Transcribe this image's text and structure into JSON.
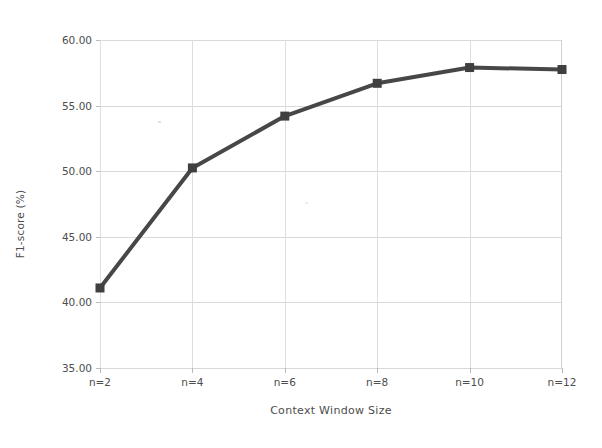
{
  "chart_data": {
    "type": "line",
    "title": "",
    "subtitle": "",
    "xlabel": "Context Window Size",
    "ylabel": "F1-score (%)",
    "categories": [
      "n=2",
      "n=4",
      "n=6",
      "n=8",
      "n=10",
      "n=12"
    ],
    "values": [
      41.1,
      50.25,
      54.2,
      56.7,
      57.9,
      57.75
    ],
    "series": [
      {
        "name": "F1-score",
        "values": [
          41.1,
          50.25,
          54.2,
          56.7,
          57.9,
          57.75
        ]
      }
    ],
    "ylim": [
      35.0,
      60.0
    ],
    "ytick_labels": [
      "35.00",
      "40.00",
      "45.00",
      "50.00",
      "55.00",
      "60.00"
    ],
    "ytick_values": [
      35.0,
      40.0,
      45.0,
      50.0,
      55.0,
      60.0
    ],
    "xtick_labels": [
      "n=2",
      "n=4",
      "n=6",
      "n=8",
      "n=10",
      "n=12"
    ],
    "grid": "horizontal-and-vertical",
    "legend": "none",
    "marker": "square",
    "line_color": "#474747",
    "marker_color": "#3f3f3f",
    "grid_color": "#d8d8dd",
    "text_color": "#4d4d4d",
    "background_color": "#ffffff"
  }
}
